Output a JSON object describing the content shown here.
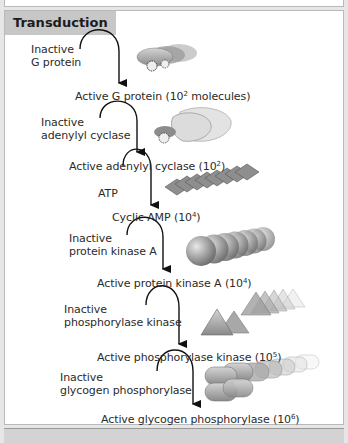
{
  "panel": {
    "title": "Transduction",
    "steps": [
      {
        "inactive": [
          "Inactive",
          "G protein"
        ],
        "active": "Active G protein (10",
        "exp": "2",
        "suffix": " molecules)",
        "shape": "g-protein"
      },
      {
        "inactive": [
          "Inactive",
          "adenylyl cyclase"
        ],
        "active": "Active adenylyl cyclase (10",
        "exp": "2",
        "suffix": ")",
        "shape": "adenylyl-cyclase"
      },
      {
        "inactive": [
          "ATP"
        ],
        "active": "Cyclic AMP (10",
        "exp": "4",
        "suffix": ")",
        "shape": "cyclic-amp"
      },
      {
        "inactive": [
          "Inactive",
          "protein kinase A"
        ],
        "active": "Active protein kinase A (10",
        "exp": "4",
        "suffix": ")",
        "shape": "protein-kinase-a"
      },
      {
        "inactive": [
          "Inactive",
          "phosphorylase kinase"
        ],
        "active": "Active phosphorylase kinase (10",
        "exp": "5",
        "suffix": ")",
        "shape": "phosphorylase-kinase"
      },
      {
        "inactive": [
          "Inactive",
          "glycogen phosphorylase"
        ],
        "active": "Active glycogen phosphorylase (10",
        "exp": "6",
        "suffix": ")",
        "shape": "glycogen-phosphorylase"
      }
    ]
  },
  "colors": {
    "header_bg": "#c7c7c7",
    "arrow": "#111111",
    "shape_fill": "#9a9a9a"
  }
}
